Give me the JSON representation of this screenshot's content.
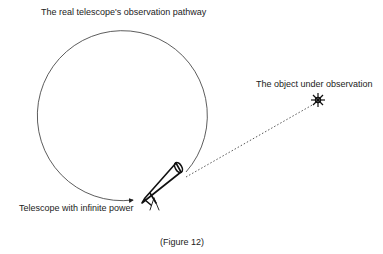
{
  "diagram": {
    "labels": {
      "pathway": "The real telescope's observation pathway",
      "object": "The object under observation",
      "telescope": "Telescope with infinite power"
    },
    "caption": "(Figure 12)"
  }
}
